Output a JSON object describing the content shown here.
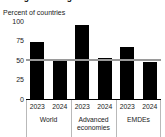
{
  "figure": {
    "title_clipped": "Rising share of growth forecasts",
    "axis_title": "Percent of countries"
  },
  "chart_data": {
    "type": "bar",
    "title": "Rising share of growth forecasts",
    "subtitle": "",
    "xlabel": "",
    "ylabel": "Percent of countries",
    "ylim": [
      0,
      100
    ],
    "yticks": [
      0,
      25,
      50,
      75,
      100
    ],
    "ytick_labels": [
      "0",
      "25",
      "50",
      "75",
      "100"
    ],
    "grid": false,
    "legend": "none",
    "reference_line": {
      "value": 50,
      "color": "#9a9a9a",
      "label": ""
    },
    "bar_color": "#000000",
    "groups": [
      "World",
      "Advanced economies",
      "EMDEs"
    ],
    "group_labels": [
      {
        "line1": "World",
        "line2": ""
      },
      {
        "line1": "Advanced",
        "line2": "economies"
      },
      {
        "line1": "EMDEs",
        "line2": ""
      }
    ],
    "categories": [
      "2023",
      "2024",
      "2023",
      "2024",
      "2023",
      "2024"
    ],
    "values": [
      73,
      49,
      95,
      53,
      67,
      47
    ],
    "points": [
      {
        "group": "World",
        "year": "2023",
        "value": 73
      },
      {
        "group": "World",
        "year": "2024",
        "value": 49
      },
      {
        "group": "Advanced economies",
        "year": "2023",
        "value": 95
      },
      {
        "group": "Advanced economies",
        "year": "2024",
        "value": 53
      },
      {
        "group": "EMDEs",
        "year": "2023",
        "value": 67
      },
      {
        "group": "EMDEs",
        "year": "2024",
        "value": 47
      }
    ]
  }
}
